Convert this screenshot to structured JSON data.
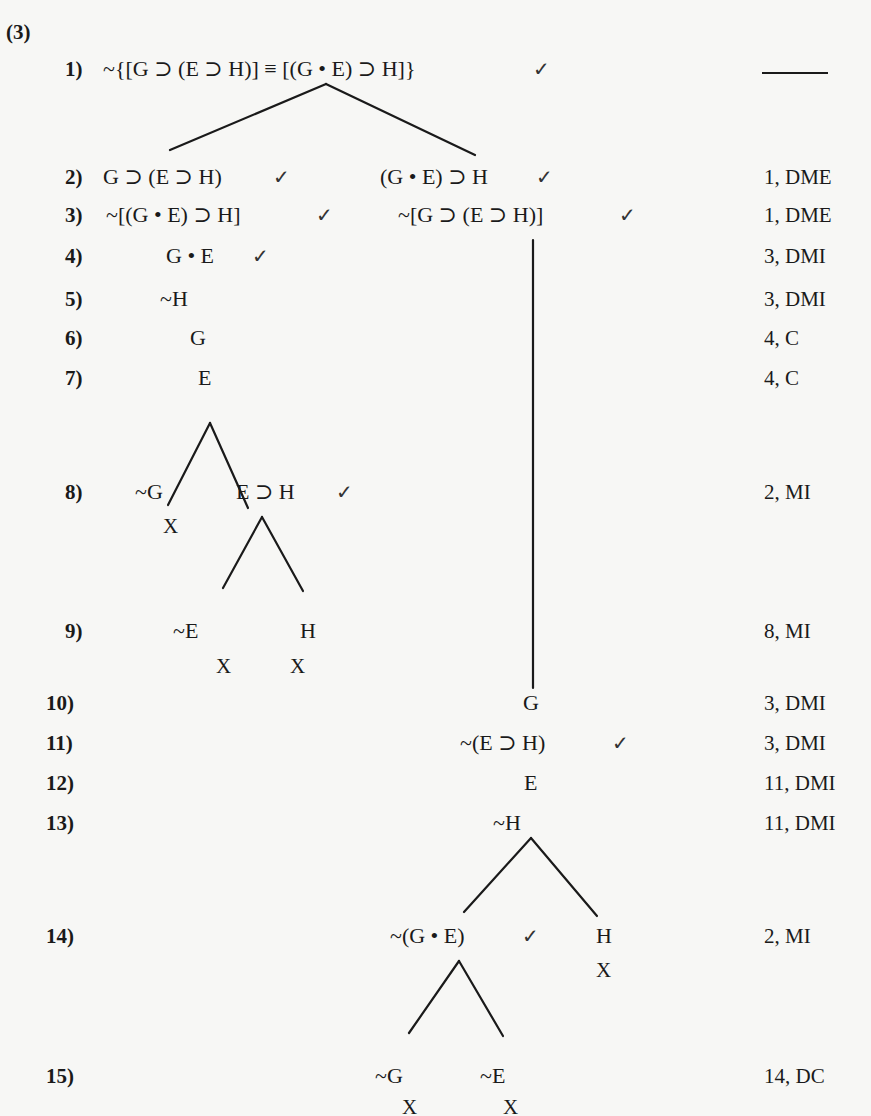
{
  "problem": {
    "number": "(3)",
    "root_justification": "—"
  },
  "rows": [
    {
      "label": "1)",
      "formulas": [
        "~{[G ⊃ (E ⊃ H)] ≡ [(G • E) ⊃ H]}"
      ],
      "checks": [
        "✓"
      ],
      "justification": ""
    },
    {
      "label": "2)",
      "formulas": [
        "G ⊃ (E ⊃ H)",
        "(G • E) ⊃ H"
      ],
      "checks": [
        "✓",
        "✓"
      ],
      "justification": "1, DME"
    },
    {
      "label": "3)",
      "formulas": [
        "~[(G • E) ⊃ H]",
        "~[G ⊃ (E ⊃ H)]"
      ],
      "checks": [
        "✓",
        "✓"
      ],
      "justification": "1, DME"
    },
    {
      "label": "4)",
      "formulas": [
        "G • E"
      ],
      "checks": [
        "✓"
      ],
      "justification": "3, DMI"
    },
    {
      "label": "5)",
      "formulas": [
        "~H"
      ],
      "checks": [],
      "justification": "3, DMI"
    },
    {
      "label": "6)",
      "formulas": [
        "G"
      ],
      "checks": [],
      "justification": "4, C"
    },
    {
      "label": "7)",
      "formulas": [
        "E"
      ],
      "checks": [],
      "justification": "4, C"
    },
    {
      "label": "8)",
      "formulas": [
        "~G",
        "E ⊃ H"
      ],
      "checks": [
        "✓"
      ],
      "closures": [
        "X"
      ],
      "justification": "2, MI"
    },
    {
      "label": "9)",
      "formulas": [
        "~E",
        "H"
      ],
      "checks": [],
      "closures": [
        "X",
        "X"
      ],
      "justification": "8, MI"
    },
    {
      "label": "10)",
      "formulas": [
        "G"
      ],
      "checks": [],
      "justification": "3, DMI"
    },
    {
      "label": "11)",
      "formulas": [
        "~(E ⊃ H)"
      ],
      "checks": [
        "✓"
      ],
      "justification": "3, DMI"
    },
    {
      "label": "12)",
      "formulas": [
        "E"
      ],
      "checks": [],
      "justification": "11, DMI"
    },
    {
      "label": "13)",
      "formulas": [
        "~H"
      ],
      "checks": [],
      "justification": "11, DMI"
    },
    {
      "label": "14)",
      "formulas": [
        "~(G • E)",
        "H"
      ],
      "checks": [
        "✓"
      ],
      "closures": [
        "X"
      ],
      "justification": "2, MI"
    },
    {
      "label": "15)",
      "formulas": [
        "~G",
        "~E"
      ],
      "checks": [],
      "closures": [
        "X",
        "X"
      ],
      "justification": "14, DC"
    }
  ],
  "colors": {
    "ink": "#1a1a1a",
    "paper": "#f7f7f5"
  }
}
